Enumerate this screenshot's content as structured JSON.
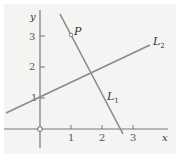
{
  "diagram": {
    "type": "coordinate-plane",
    "axes": {
      "x_label": "x",
      "y_label": "y",
      "x_ticks": [
        "1",
        "2",
        "3"
      ],
      "y_ticks": [
        "1",
        "2",
        "3"
      ]
    },
    "lines": [
      {
        "label_main": "L",
        "label_sub": "1",
        "equation_estimate": "y = -2x + 5"
      },
      {
        "label_main": "L",
        "label_sub": "2",
        "equation_estimate": "y = x/2 + 1"
      }
    ],
    "point": {
      "label": "P",
      "coords_estimate": [
        1,
        3
      ]
    },
    "origin_marker": "open-circle",
    "colors": {
      "line": "#8a8a8a",
      "axis": "#777777",
      "background": "#f4f4f2"
    }
  }
}
